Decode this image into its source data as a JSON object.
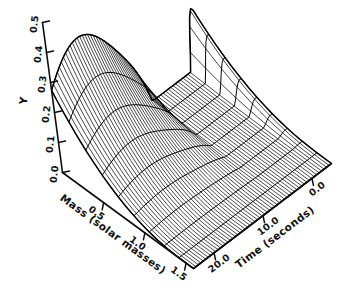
{
  "figure": {
    "kind": "3d-surface-wireframe",
    "background_color": "#ffffff",
    "ink_color": "#000000",
    "title": ""
  },
  "axes": {
    "vertical": {
      "name": "Y",
      "label": "Y",
      "ticks": [
        "0.5",
        "0.4",
        "0.3",
        "0.2",
        "0.1",
        "0.0"
      ],
      "tick_values": [
        0.5,
        0.4,
        0.3,
        0.2,
        0.1,
        0.0
      ],
      "range": [
        0.0,
        0.5
      ]
    },
    "left_depth": {
      "name": "Mass",
      "label": "Mass (solar masses)",
      "ticks": [
        "0.5",
        "1.0",
        "1.5"
      ],
      "tick_values": [
        0.5,
        1.0,
        1.5
      ],
      "range": [
        0.0,
        1.6
      ]
    },
    "right_depth": {
      "name": "Time",
      "label": "Time (seconds)",
      "ticks": [
        "20.0",
        "10.0",
        "0.0"
      ],
      "tick_values": [
        20.0,
        10.0,
        0.0
      ],
      "range": [
        0.0,
        25.0
      ]
    }
  },
  "chart_data": {
    "type": "surface",
    "title": "",
    "xlabel": "Time (seconds)",
    "ylabel": "Mass (solar masses)",
    "zlabel": "Y",
    "grid": false,
    "legend": null,
    "x": [
      0.0,
      10.0,
      20.0
    ],
    "y": [
      0.5,
      1.0,
      1.5
    ],
    "zlim": [
      0.0,
      0.5
    ],
    "xlim": [
      0.0,
      25.0
    ],
    "ylim": [
      0.0,
      1.6
    ],
    "xtick_labels": [
      "20.0",
      "10.0",
      "0.0"
    ],
    "ytick_labels": [
      "0.5",
      "1.0",
      "1.5"
    ],
    "ztick_labels": [
      "0.5",
      "0.4",
      "0.3",
      "0.2",
      "0.1",
      "0.0"
    ],
    "mesh_density": {
      "time_lines": 56,
      "mass_lines": 9
    },
    "notable_features": [
      {
        "feature": "ridge-crest",
        "approx_z": 0.47
      },
      {
        "feature": "saddle-trough",
        "approx_z": 0.17
      },
      {
        "feature": "flat-plain",
        "approx_z": 0.02
      }
    ]
  }
}
